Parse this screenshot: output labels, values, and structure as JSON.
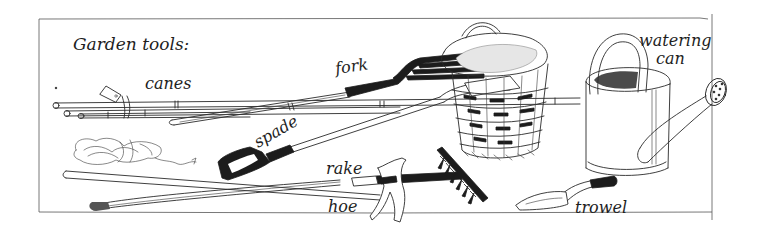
{
  "illustration": {
    "title": "Garden tools:",
    "labels": {
      "canes": "canes",
      "fork": "fork",
      "spade": "spade",
      "rake": "rake",
      "hoe": "hoe",
      "watering_can_line1": "watering",
      "watering_can_line2": "can",
      "trowel": "trowel"
    },
    "colors": {
      "ink": "#1c1c1c",
      "paper": "#ffffff",
      "frame": "#555555"
    }
  }
}
